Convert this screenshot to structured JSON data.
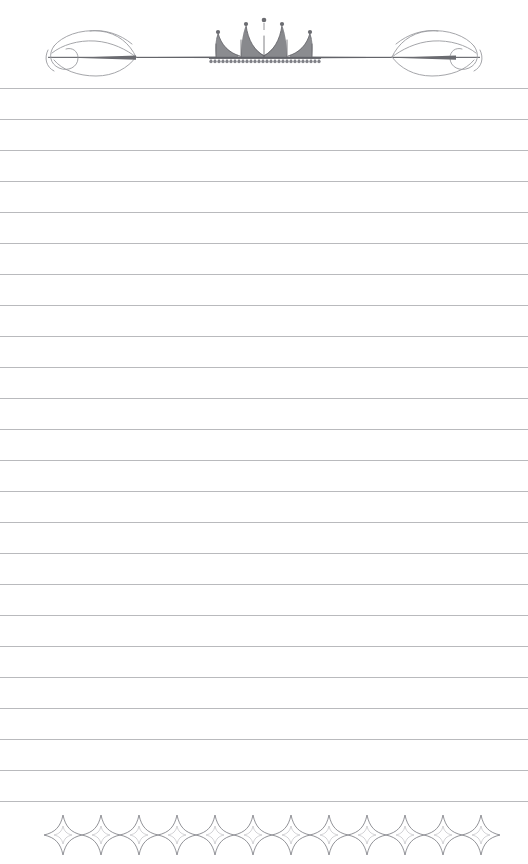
{
  "document": {
    "kind": "ruled-stationery-page",
    "title": "",
    "body_text": "",
    "page_width": 528,
    "page_height": 864,
    "background_color": "#ffffff"
  },
  "header": {
    "ornament_name": "crown-flourish-divider",
    "crown": {
      "name": "crown-ornament",
      "points": 5,
      "finials": 5,
      "has_beaded_band": true,
      "bead_count": 28,
      "color": "#6d6e72"
    },
    "left_flourish": {
      "name": "left-scroll-flourish",
      "color": "#9a9b9f"
    },
    "right_flourish": {
      "name": "right-scroll-flourish",
      "color": "#9a9b9f"
    },
    "rule": {
      "name": "header-rule",
      "color": "#5e5f63",
      "y": 57,
      "start_x": 48,
      "end_x": 480
    }
  },
  "ruled_lines": {
    "name": "ruled-lines-group",
    "count": 24,
    "color": "#b9babd",
    "thickness": 1,
    "spacing": 31,
    "first_y": 88,
    "left_x": 0,
    "right_x": 528,
    "y_positions": [
      88,
      119,
      150,
      181,
      212,
      243,
      274,
      305,
      336,
      367,
      398,
      429,
      460,
      491,
      522,
      553,
      584,
      615,
      646,
      677,
      708,
      739,
      770,
      801
    ]
  },
  "footer": {
    "ornament_name": "four-point-star-border",
    "star": {
      "name": "four-point-star",
      "count": 12,
      "width": 38,
      "height": 40,
      "outline_color": "#85868b",
      "fill_color": "#ffffff",
      "inner_star_color": "#c6c7ca"
    },
    "band": {
      "start_x": 44,
      "end_x": 496,
      "center_y": 836
    }
  }
}
